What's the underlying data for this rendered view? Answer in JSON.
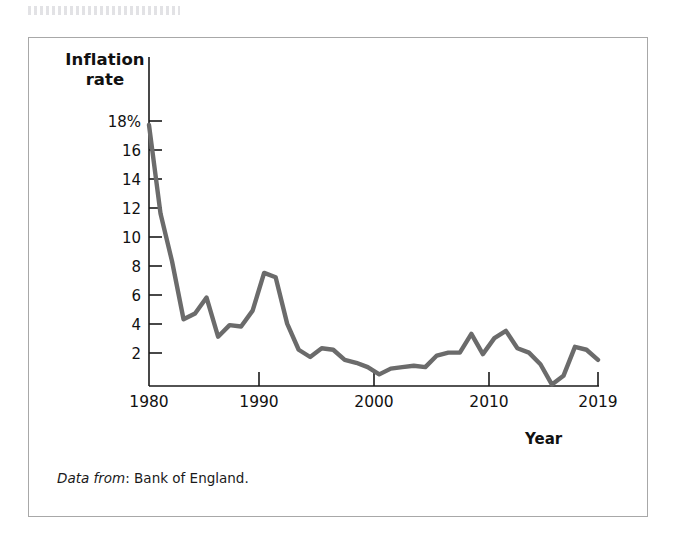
{
  "figure": {
    "caption_label": "Data from",
    "caption_separator": ": ",
    "caption_source": "Bank of England.",
    "line_color": "#6b6b6b",
    "axis_color": "#1a1a1a",
    "frame_color": "#a8a8a8"
  },
  "chart_data": {
    "type": "line",
    "title": "",
    "xlabel": "Year",
    "ylabel": "Inflation rate",
    "ylabel_line1": "Inflation",
    "ylabel_line2": "rate",
    "grid": false,
    "legend": "none",
    "xlim": [
      1980,
      2019
    ],
    "ylim": [
      0,
      19
    ],
    "xticks": [
      1980,
      1990,
      2000,
      2010,
      2019
    ],
    "xticklabels": [
      "1980",
      "1990",
      "2000",
      "2010",
      "2019"
    ],
    "yticks": [
      2,
      4,
      6,
      8,
      10,
      12,
      14,
      16,
      18
    ],
    "yticklabels": [
      "2",
      "4",
      "6",
      "8",
      "10",
      "12",
      "14",
      "16",
      "18%"
    ],
    "series": [
      {
        "name": "UK inflation rate",
        "x": [
          1980,
          1981,
          1982,
          1983,
          1984,
          1985,
          1986,
          1987,
          1988,
          1989,
          1990,
          1991,
          1992,
          1993,
          1994,
          1995,
          1996,
          1997,
          1998,
          1999,
          2000,
          2001,
          2002,
          2003,
          2004,
          2005,
          2006,
          2007,
          2008,
          2009,
          2010,
          2011,
          2012,
          2013,
          2014,
          2015,
          2016,
          2017,
          2018,
          2019
        ],
        "values": [
          18.0,
          11.9,
          8.6,
          4.6,
          5.0,
          6.1,
          3.4,
          4.2,
          4.1,
          5.2,
          7.8,
          7.5,
          4.3,
          2.5,
          2.0,
          2.6,
          2.5,
          1.8,
          1.6,
          1.3,
          0.8,
          1.2,
          1.3,
          1.4,
          1.3,
          2.1,
          2.3,
          2.3,
          3.6,
          2.2,
          3.3,
          3.8,
          2.6,
          2.3,
          1.5,
          0.1,
          0.7,
          2.7,
          2.5,
          1.8
        ]
      }
    ]
  },
  "axis_geometry": {
    "x_left_px": 148,
    "x_right_px": 597,
    "y_zero_px": 381,
    "y_per_percent_px": 14.5,
    "plot_top_px": 110,
    "x_per_year_px": 11.513
  }
}
